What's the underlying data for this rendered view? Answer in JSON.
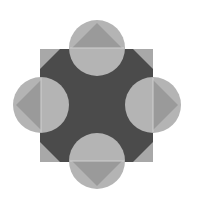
{
  "figure": {
    "canvas": {
      "width": 199,
      "height": 200,
      "background": "#ffffff"
    },
    "colors": {
      "square": "#a8a8a8",
      "octagon": "#4b4b4b",
      "circle": "#b4b4b4",
      "triangle": "#9a9a9a",
      "edge_line": "#d0d0d0"
    },
    "square": {
      "x": 40,
      "y": 49,
      "size": 113
    },
    "octagon_chamfer": 20,
    "circle_radius": 28,
    "circles": [
      {
        "name": "top",
        "cx": 97,
        "cy": 48,
        "direction": "up"
      },
      {
        "name": "left",
        "cx": 41,
        "cy": 105,
        "direction": "left"
      },
      {
        "name": "right",
        "cx": 153,
        "cy": 105,
        "direction": "right"
      },
      {
        "name": "bottom",
        "cx": 97,
        "cy": 161,
        "direction": "down"
      }
    ]
  }
}
